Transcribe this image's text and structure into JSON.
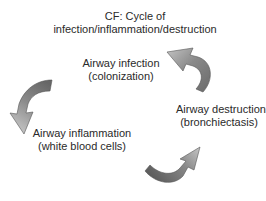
{
  "title": {
    "line1": "CF: Cycle of",
    "line2": "infection/inflammation/destruction"
  },
  "nodes": [
    {
      "id": "infection",
      "line1": "Airway infection",
      "line2": "(colonization)"
    },
    {
      "id": "destruction",
      "line1": "Airway destruction",
      "line2": "(bronchiectasis)"
    },
    {
      "id": "inflammation",
      "line1": "Airway inflammation",
      "line2": "(white blood cells)"
    }
  ],
  "arrows": [
    {
      "from": "destruction",
      "to": "infection",
      "icon": "curved-arrow-icon"
    },
    {
      "from": "infection",
      "to": "inflammation",
      "icon": "curved-arrow-icon"
    },
    {
      "from": "inflammation",
      "to": "destruction",
      "icon": "curved-arrow-icon"
    }
  ],
  "colors": {
    "arrow_dark": "#6e6e6e",
    "arrow_light": "#b8b8b8",
    "text": "#2a2a2a"
  }
}
